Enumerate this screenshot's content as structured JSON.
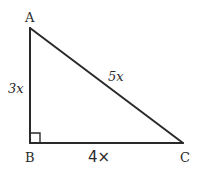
{
  "diagram": {
    "type": "right-triangle",
    "stroke_color": "#2a2a2a",
    "background": "#ffffff",
    "vertices": {
      "A": {
        "label": "A",
        "x": 30,
        "y": 28
      },
      "B": {
        "label": "B",
        "x": 30,
        "y": 143
      },
      "C": {
        "label": "C",
        "x": 183,
        "y": 143
      }
    },
    "sides": {
      "AB": {
        "label": "3x"
      },
      "AC": {
        "label": "5x"
      },
      "BC": {
        "label": "4×"
      }
    },
    "right_angle_at": "B"
  }
}
